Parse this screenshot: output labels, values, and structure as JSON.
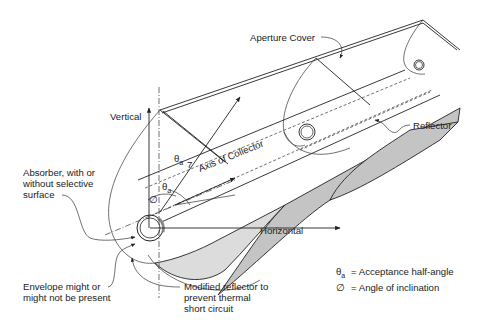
{
  "figure": {
    "type": "diagram"
  },
  "labels": {
    "aperture_cover": "Aperture Cover",
    "reflector": "Reflector",
    "vertical": "Vertical",
    "axis_of_collector": "Axis of Collector",
    "horizontal": "Horizontal",
    "absorber_line1": "Absorber, with or",
    "absorber_line2": "without selective",
    "absorber_line3": "surface",
    "envelope_line1": "Envelope might or",
    "envelope_line2": "might not be present",
    "modified_line1": "Modified reflector to",
    "modified_line2": "prevent thermal",
    "modified_line3": "short circuit",
    "theta_a_symbol": "θ",
    "theta_a_sub": "a",
    "phi_symbol": "∅"
  },
  "legend": {
    "items": [
      {
        "symbol": "θ",
        "sub": "a",
        "text": "= Acceptance half-angle"
      },
      {
        "symbol": "∅",
        "sub": "",
        "text": "= Angle of inclination"
      }
    ]
  },
  "colors": {
    "line": "#222222",
    "shade": "#c4c4c4",
    "background": "#ffffff"
  }
}
